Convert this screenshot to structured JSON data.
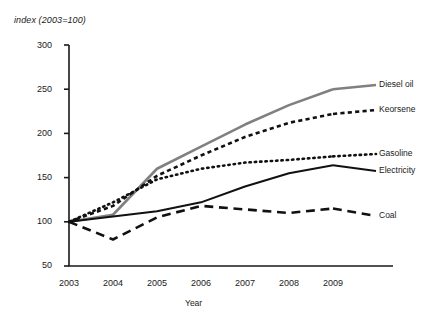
{
  "chart_data": {
    "type": "line",
    "title": "",
    "ylabel": "index (2003=100)",
    "xlabel": "Year",
    "categories": [
      "2003",
      "2004",
      "2005",
      "2006",
      "2007",
      "2008",
      "2009"
    ],
    "x": [
      2003,
      2004,
      2005,
      2006,
      2007,
      2008,
      2009
    ],
    "ylim": [
      50,
      300
    ],
    "yticks": [
      50,
      100,
      150,
      200,
      250,
      300
    ],
    "grid": false,
    "legend_position": "right-of-plot-line-end",
    "series": [
      {
        "name": "Diesel oil",
        "values": [
          100,
          108,
          160,
          185,
          210,
          232,
          250
        ],
        "color": "#808080",
        "style": "solid",
        "width": 2.6
      },
      {
        "name": "Keorsene",
        "values": [
          100,
          118,
          152,
          175,
          196,
          212,
          222
        ],
        "color": "#111111",
        "style": "dashed",
        "width": 2.6
      },
      {
        "name": "Gasoline",
        "values": [
          100,
          122,
          148,
          160,
          167,
          170,
          174
        ],
        "color": "#111111",
        "style": "dotted",
        "width": 2.6
      },
      {
        "name": "Electricity",
        "values": [
          100,
          106,
          112,
          122,
          140,
          155,
          164
        ],
        "color": "#111111",
        "style": "solid",
        "width": 2.0
      },
      {
        "name": "Coal",
        "values": [
          100,
          80,
          105,
          118,
          114,
          110,
          115
        ],
        "color": "#111111",
        "style": "longdash",
        "width": 2.6
      }
    ]
  },
  "axis": {
    "ytick_labels": [
      "300",
      "250",
      "200",
      "150",
      "100",
      "50"
    ],
    "xtick_labels": [
      "2003",
      "2004",
      "2005",
      "2006",
      "2007",
      "2008",
      "2009"
    ]
  },
  "legend": {
    "labels": [
      "Diesel oil",
      "Keorsene",
      "Gasoline",
      "Electricity",
      "Coal"
    ]
  }
}
